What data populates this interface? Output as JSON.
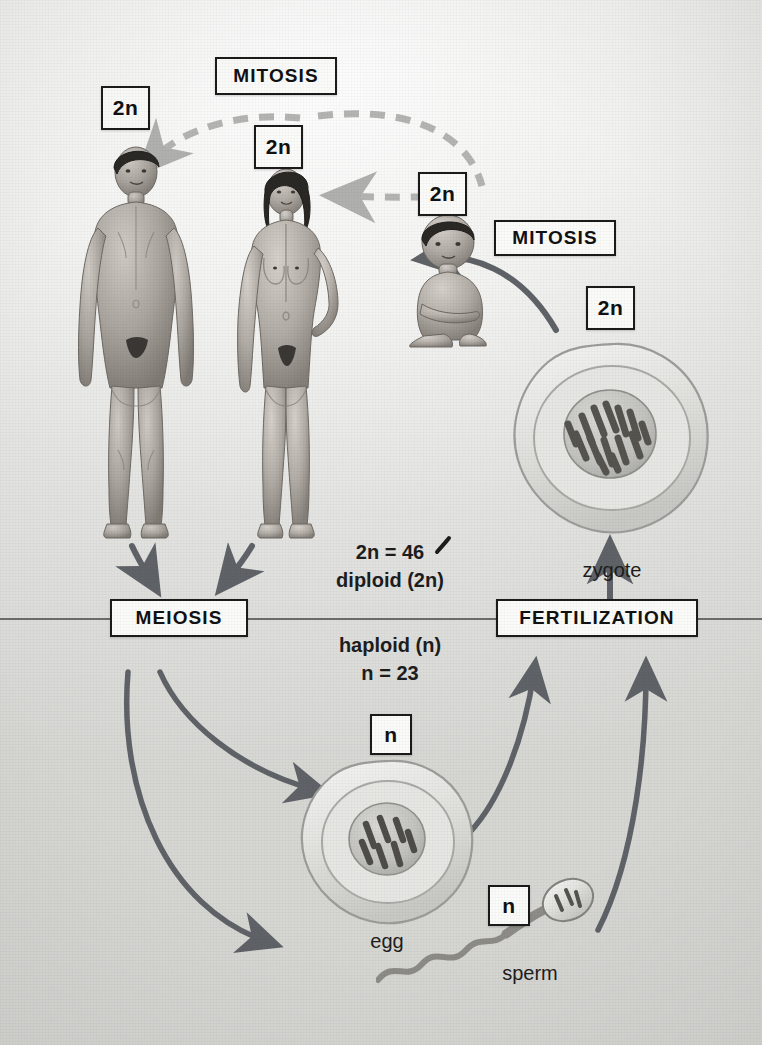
{
  "diagram": {
    "background_color": "#e8e8e6",
    "ink_color": "#1b1b1b",
    "arrow_color": "#5f6367",
    "dashed_arrow_color": "#b4b4b2"
  },
  "process_labels": {
    "mitosis_top": "MITOSIS",
    "mitosis_right": "MITOSIS",
    "meiosis": "MEIOSIS",
    "fertilization": "FERTILIZATION"
  },
  "ploidy_labels": {
    "male_adult": "2n",
    "female_adult": "2n",
    "child": "2n",
    "zygote": "2n",
    "egg": "n",
    "sperm": "n"
  },
  "annotations": {
    "diploid_count": "2n = 46",
    "diploid_word": "diploid (2n)",
    "haploid_word": "haploid (n)",
    "haploid_count": "n = 23"
  },
  "cell_captions": {
    "zygote": "zygote",
    "egg": "egg",
    "sperm": "sperm"
  },
  "figures": {
    "male_adult": "adult-male",
    "female_adult": "adult-female",
    "child": "child",
    "zygote_cell": "zygote-cell",
    "egg_cell": "egg-cell",
    "sperm_cell": "sperm-cell"
  },
  "chromosomes": {
    "zygote_count": 14,
    "egg_count": 7
  }
}
